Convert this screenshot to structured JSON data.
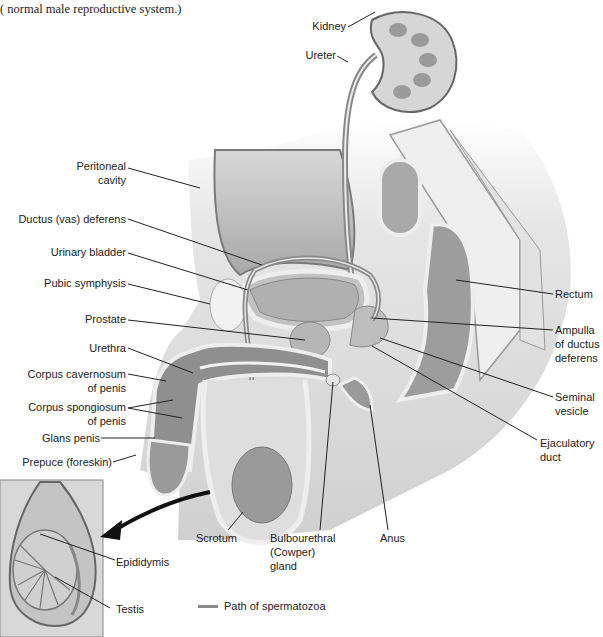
{
  "caption": "( normal male reproductive system.)",
  "labels": {
    "kidney": "Kidney",
    "ureter": "Ureter",
    "peritoneal_cavity_1": "Peritoneal",
    "peritoneal_cavity_2": "cavity",
    "ductus_deferens": "Ductus (vas) deferens",
    "urinary_bladder": "Urinary bladder",
    "pubic_symphysis": "Pubic symphysis",
    "prostate": "Prostate",
    "urethra": "Urethra",
    "corpus_cavernosum_1": "Corpus cavernosum",
    "corpus_cavernosum_2": "of penis",
    "corpus_spongiosum_1": "Corpus spongiosum",
    "corpus_spongiosum_2": "of penis",
    "glans_penis": "Glans penis",
    "prepuce": "Prepuce (foreskin)",
    "rectum": "Rectum",
    "ampulla_1": "Ampulla",
    "ampulla_2": "of ductus",
    "ampulla_3": "deferens",
    "seminal_vesicle_1": "Seminal",
    "seminal_vesicle_2": "vesicle",
    "ejaculatory_duct_1": "Ejaculatory",
    "ejaculatory_duct_2": "duct",
    "scrotum": "Scrotum",
    "bulbourethral_1": "Bulbourethral",
    "bulbourethral_2": "(Cowper)",
    "bulbourethral_3": "gland",
    "anus": "Anus",
    "epididymis": "Epididymis",
    "testis": "Testis"
  },
  "legend": {
    "path_label": "Path of spermatozoa",
    "path_color": "#8a8a8a"
  },
  "colors": {
    "body_light": "#e4e4e4",
    "body_mid": "#c8c8c8",
    "organ_dark": "#9a9a9a",
    "organ_mid": "#b4b4b4",
    "outline": "#6e6e6e",
    "bone": "#f0f0f0",
    "leader": "#222222"
  }
}
